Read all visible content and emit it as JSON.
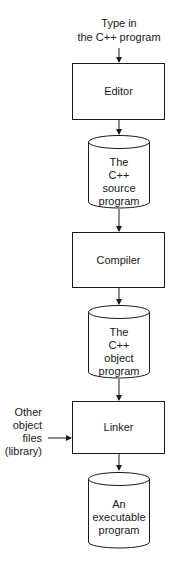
{
  "diagram": {
    "input_label": [
      "Type in",
      "the C++ program"
    ],
    "nodes": [
      {
        "id": "editor",
        "type": "process",
        "label": [
          "Editor"
        ]
      },
      {
        "id": "source",
        "type": "storage",
        "label": [
          "The",
          "C++",
          "source",
          "program"
        ]
      },
      {
        "id": "compiler",
        "type": "process",
        "label": [
          "Compiler"
        ]
      },
      {
        "id": "object",
        "type": "storage",
        "label": [
          "The",
          "C++",
          "object",
          "program"
        ]
      },
      {
        "id": "linker",
        "type": "process",
        "label": [
          "Linker"
        ]
      },
      {
        "id": "executable",
        "type": "storage",
        "label": [
          "An",
          "executable",
          "program"
        ]
      }
    ],
    "side_input_label": [
      "Other",
      "object",
      "files",
      "(library)"
    ],
    "edges": [
      {
        "from": "input",
        "to": "editor"
      },
      {
        "from": "editor",
        "to": "source"
      },
      {
        "from": "source",
        "to": "compiler"
      },
      {
        "from": "compiler",
        "to": "object"
      },
      {
        "from": "object",
        "to": "linker"
      },
      {
        "from": "library",
        "to": "linker"
      },
      {
        "from": "linker",
        "to": "executable"
      }
    ],
    "colors": {
      "stroke": "#1a1a1a",
      "background": "#ffffff"
    }
  }
}
